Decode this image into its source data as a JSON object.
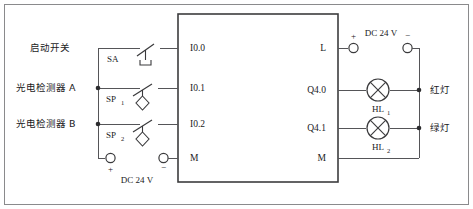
{
  "diagram": {
    "plc": {
      "name": "plc-unit",
      "inputs": [
        {
          "terminal": "I0.0"
        },
        {
          "terminal": "I0.1"
        },
        {
          "terminal": "I0.2"
        },
        {
          "terminal": "M"
        }
      ],
      "outputs": [
        {
          "terminal": "L"
        },
        {
          "terminal": "Q4.0"
        },
        {
          "terminal": "Q4.1"
        },
        {
          "terminal": "M"
        }
      ]
    },
    "input_devices": [
      {
        "label": "启动开关",
        "designation": "SA",
        "designation_sub": "",
        "symbol": "pushbutton",
        "wired_to": "I0.0"
      },
      {
        "label": "光电检测器 A",
        "designation": "SP",
        "designation_sub": "1",
        "symbol": "proximity-sensor",
        "wired_to": "I0.1"
      },
      {
        "label": "光电检测器 B",
        "designation": "SP",
        "designation_sub": "2",
        "symbol": "proximity-sensor",
        "wired_to": "I0.2"
      }
    ],
    "output_devices": [
      {
        "label": "红灯",
        "designation": "HL",
        "designation_sub": "1",
        "symbol": "lamp",
        "wired_to": "Q4.0"
      },
      {
        "label": "绿灯",
        "designation": "HL",
        "designation_sub": "2",
        "symbol": "lamp",
        "wired_to": "Q4.1"
      }
    ],
    "power_supplies": [
      {
        "name": "input-supply",
        "label": "DC 24 V",
        "positive_sign": "+",
        "negative_sign": "−"
      },
      {
        "name": "output-supply",
        "label": "DC 24 V",
        "positive_sign": "+",
        "negative_sign": "−"
      }
    ]
  }
}
